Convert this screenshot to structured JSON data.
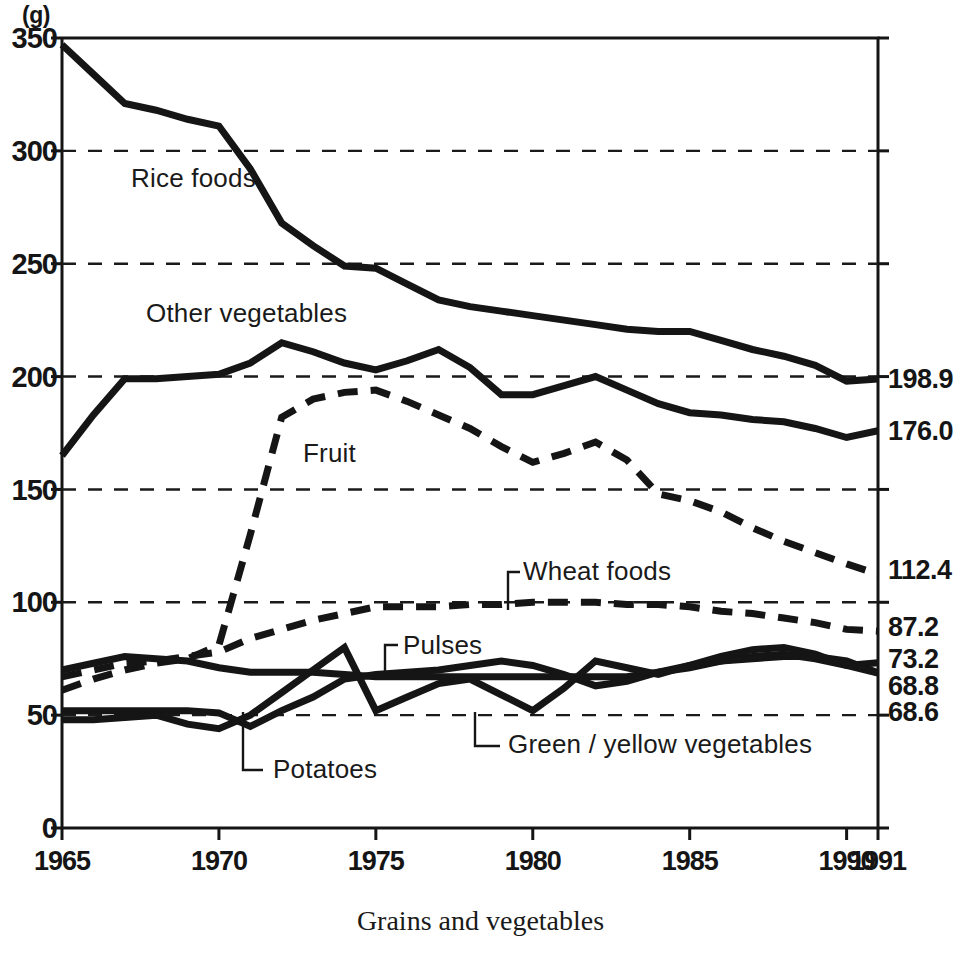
{
  "caption": "Grains and vegetables",
  "unit_label": "(g)",
  "axis": {
    "y_ticks": [
      "350",
      "300",
      "250",
      "200",
      "150",
      "100",
      "50",
      "0"
    ],
    "x_ticks": [
      "1965",
      "1970",
      "1975",
      "1980",
      "1985",
      "1990",
      "1991"
    ]
  },
  "end_labels": [
    {
      "text": "198.9",
      "value": 198.9
    },
    {
      "text": "176.0",
      "value": 176.0
    },
    {
      "text": "112.4",
      "value": 112.4
    },
    {
      "text": "87.2",
      "value": 87.2
    },
    {
      "text": "73.2",
      "value": 73.2
    },
    {
      "text": "68.8",
      "value": 68.8
    },
    {
      "text": "68.6",
      "value": 68.6
    }
  ],
  "series_labels": [
    {
      "text": "Rice foods"
    },
    {
      "text": "Other vegetables"
    },
    {
      "text": "Fruit"
    },
    {
      "text": "Wheat foods"
    },
    {
      "text": "Pulses"
    },
    {
      "text": "Potatoes"
    },
    {
      "text": "Green / yellow vegetables"
    }
  ],
  "colors": {
    "ink": "#151515",
    "background": "#ffffff",
    "gridline": "#1a1a1a"
  },
  "chart_data": {
    "type": "line",
    "title": "",
    "subtitle": "",
    "xlabel": "",
    "ylabel": "(g)",
    "caption": "Grains and vegetables",
    "xlim": [
      1965,
      1991
    ],
    "ylim": [
      0,
      350
    ],
    "yticks": [
      0,
      50,
      100,
      150,
      200,
      250,
      300,
      350
    ],
    "xticks": [
      1965,
      1970,
      1975,
      1980,
      1985,
      1990,
      1991
    ],
    "grid": "horizontal dashed gridlines at 50,100,150,200,250,300",
    "legend": "inline labels with leader lines",
    "x": [
      1965,
      1966,
      1967,
      1968,
      1969,
      1970,
      1971,
      1972,
      1973,
      1974,
      1975,
      1976,
      1977,
      1978,
      1979,
      1980,
      1981,
      1982,
      1983,
      1984,
      1985,
      1986,
      1987,
      1988,
      1989,
      1990,
      1991
    ],
    "series": [
      {
        "name": "Rice foods",
        "style": "solid-thick",
        "end_value": 198.9,
        "values": [
          347,
          334,
          321,
          318,
          314,
          311,
          292,
          268,
          258,
          249,
          248,
          241,
          234,
          231,
          229,
          227,
          225,
          223,
          221,
          220,
          220,
          216,
          212,
          209,
          205,
          198,
          198.9
        ]
      },
      {
        "name": "Other vegetables",
        "style": "solid-thick",
        "end_value": 176.0,
        "values": [
          165,
          183,
          199,
          199,
          200,
          201,
          206,
          215,
          211,
          206,
          203,
          207,
          212,
          204,
          192,
          192,
          196,
          200,
          194,
          188,
          184,
          183,
          181,
          180,
          177,
          173,
          176.0
        ]
      },
      {
        "name": "Fruit",
        "style": "dashed-thick",
        "end_value": 112.4,
        "values": [
          61,
          66,
          70,
          73,
          75,
          81,
          130,
          182,
          190,
          193,
          194,
          189,
          183,
          177,
          169,
          162,
          166,
          171,
          163,
          148,
          145,
          140,
          133,
          127,
          122,
          117,
          112.4
        ]
      },
      {
        "name": "Wheat foods",
        "style": "dashed-thick",
        "end_value": 87.2,
        "values": [
          67,
          70,
          73,
          74,
          76,
          78,
          84,
          88,
          92,
          95,
          98,
          98,
          98,
          99,
          99,
          100,
          100,
          100,
          99,
          99,
          98,
          96,
          95,
          93,
          91,
          88,
          87.2
        ]
      },
      {
        "name": "Pulses",
        "style": "solid-thick",
        "end_value": 73.2,
        "values": [
          70,
          73,
          76,
          75,
          74,
          71,
          69,
          69,
          69,
          68,
          67,
          67,
          67,
          67,
          67,
          67,
          67,
          67,
          67,
          69,
          71,
          74,
          76,
          77,
          75,
          72,
          73.2
        ]
      },
      {
        "name": "Potatoes",
        "style": "solid-thick",
        "end_value": 68.8,
        "values": [
          52,
          52,
          52,
          52,
          52,
          51,
          45,
          52,
          58,
          66,
          68,
          69,
          70,
          72,
          74,
          72,
          68,
          63,
          65,
          69,
          72,
          74,
          75,
          76,
          76,
          74,
          68.8
        ]
      },
      {
        "name": "Green / yellow vegetables",
        "style": "solid-thick",
        "end_value": 68.6,
        "values": [
          48,
          48,
          49,
          50,
          46,
          44,
          50,
          60,
          70,
          80,
          52,
          58,
          64,
          66,
          59,
          52,
          62,
          74,
          71,
          68,
          72,
          76,
          79,
          80,
          77,
          72,
          68.6
        ]
      }
    ]
  }
}
